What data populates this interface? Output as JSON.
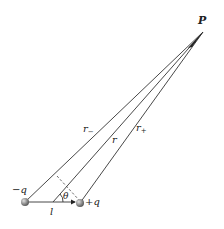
{
  "diagram": {
    "labels": {
      "point": "P",
      "neg_charge": "−q",
      "pos_charge": "+q",
      "r_minus": "r",
      "r_minus_sub": "−",
      "r_center": "r",
      "r_plus": "r",
      "r_plus_sub": "+",
      "angle": "θ",
      "separation": "l"
    },
    "points": {
      "P": [
        203,
        32
      ],
      "neg_charge": [
        25,
        202
      ],
      "pos_charge": [
        80,
        203
      ],
      "midpoint": [
        53,
        202
      ]
    },
    "colors": {
      "line": "#333333",
      "charge_fill": "#8a8a8a",
      "charge_highlight": "#d8d8d8",
      "background": "#ffffff"
    }
  }
}
